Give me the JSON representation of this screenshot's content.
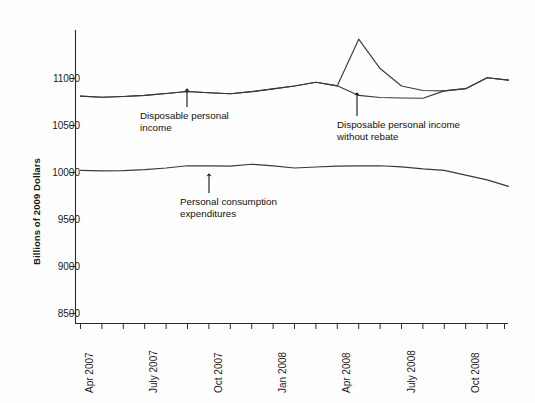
{
  "chart_data": {
    "type": "line",
    "title": "",
    "subtitle": "",
    "xlabel": "",
    "ylabel": "Billions of 2009 Dollars",
    "ylim": [
      8500,
      11500
    ],
    "yticks": [
      8500,
      9000,
      9500,
      10000,
      10500,
      11000
    ],
    "ytick_labels": [
      "8500",
      "9000",
      "9500",
      "10000",
      "10500",
      "11000"
    ],
    "grid": false,
    "legend": "none (inline annotations with arrows)",
    "x_axis_type": "monthly time axis",
    "x_range": [
      "Apr 2007",
      "Dec 2008"
    ],
    "xtick_labels": [
      "Apr 2007",
      "July 2007",
      "Oct 2007",
      "Jan 2008",
      "Apr 2008",
      "July 2008",
      "Oct 2008"
    ],
    "xtick_months": [
      "2007-04",
      "2007-07",
      "2007-10",
      "2008-01",
      "2008-04",
      "2008-07",
      "2008-10"
    ],
    "x": [
      "2007-04",
      "2007-05",
      "2007-06",
      "2007-07",
      "2007-08",
      "2007-09",
      "2007-10",
      "2007-11",
      "2007-12",
      "2008-01",
      "2008-02",
      "2008-03",
      "2008-04",
      "2008-05",
      "2008-06",
      "2008-07",
      "2008-08",
      "2008-09",
      "2008-10",
      "2008-11",
      "2008-12"
    ],
    "series": [
      {
        "name": "Disposable personal income",
        "color": "#3a3a3a",
        "values": [
          10812,
          10800,
          10808,
          10820,
          10840,
          10862,
          10848,
          10838,
          10860,
          10890,
          10920,
          10960,
          10922,
          11418,
          11106,
          10920,
          10872,
          10868,
          10892,
          11008,
          10982
        ]
      },
      {
        "name": "Disposable personal income without rebate",
        "color": "#3a3a3a",
        "values": [
          10812,
          10800,
          10808,
          10820,
          10840,
          10862,
          10848,
          10838,
          10860,
          10890,
          10920,
          10960,
          10922,
          10820,
          10798,
          10792,
          10790,
          10868,
          10892,
          11008,
          10982
        ]
      },
      {
        "name": "Personal consumption expenditures",
        "color": "#3a3a3a",
        "values": [
          10022,
          10018,
          10020,
          10030,
          10048,
          10072,
          10070,
          10068,
          10088,
          10070,
          10048,
          10058,
          10068,
          10070,
          10072,
          10060,
          10038,
          10022,
          9972,
          9922,
          9852
        ]
      }
    ],
    "annotations": [
      {
        "id": "dpi-annotation",
        "text_line1": "Disposable personal",
        "text_line2": "income",
        "points_to": "Disposable personal income line near Sep 2007"
      },
      {
        "id": "dpi-no-rebate-annotation",
        "text_line1": "Disposable personal income",
        "text_line2": "without rebate",
        "points_to": "Disposable personal income without rebate line near Jun 2008"
      },
      {
        "id": "pce-annotation",
        "text_line1": "Personal consumption",
        "text_line2": "expenditures",
        "points_to": "Personal consumption expenditures line near Oct 2007"
      }
    ]
  }
}
